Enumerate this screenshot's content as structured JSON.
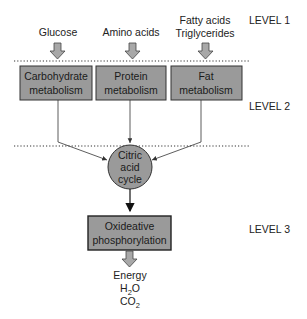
{
  "inputs": {
    "glucose": "Glucose",
    "amino_acids": "Amino acids",
    "fatty_acids_line1": "Fatty acids",
    "fatty_acids_line2": "Triglycerides"
  },
  "levels": {
    "level1": "LEVEL 1",
    "level2": "LEVEL 2",
    "level3": "LEVEL 3"
  },
  "boxes": {
    "carbohydrate": {
      "line1": "Carbohydrate",
      "line2": "metabolism"
    },
    "protein": {
      "line1": "Protein",
      "line2": "metabolism"
    },
    "fat": {
      "line1": "Fat",
      "line2": "metabolism"
    },
    "oxidative": {
      "line1": "Oxideative",
      "line2": "phosphorylation"
    }
  },
  "citric": {
    "line1": "Citric",
    "line2": "acid",
    "line3": "cycle"
  },
  "outputs": {
    "energy": "Energy",
    "water_main": "H",
    "water_sub": "2",
    "water_end": "O",
    "co2_main": "CO",
    "co2_sub": "2"
  },
  "colors": {
    "box_fill": "#9a9a9a",
    "arrow_fill": "#a8a8a8",
    "line": "#333333"
  }
}
